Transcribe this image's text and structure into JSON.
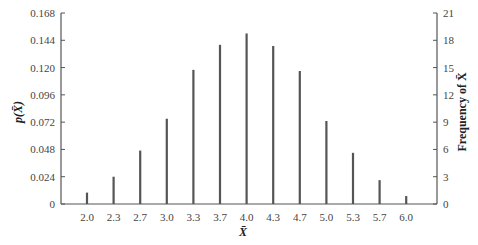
{
  "chart_data": {
    "type": "bar",
    "title": "",
    "xlabel": "X̄",
    "ylabel": "p(X̄)",
    "y2label": "Frequency of X̄",
    "categories": [
      "2.0",
      "2.3",
      "2.7",
      "3.0",
      "3.3",
      "3.7",
      "4.0",
      "4.3",
      "4.7",
      "5.0",
      "5.3",
      "5.7",
      "6.0"
    ],
    "values": [
      0.01,
      0.024,
      0.047,
      0.075,
      0.118,
      0.14,
      0.15,
      0.139,
      0.117,
      0.073,
      0.045,
      0.021,
      0.007
    ],
    "ylim": [
      0,
      0.168
    ],
    "yticks": [
      "0",
      "0.024",
      "0.048",
      "0.072",
      "0.096",
      "0.120",
      "0.144",
      "0.168"
    ],
    "y2lim": [
      0,
      21
    ],
    "y2ticks": [
      "0",
      "3",
      "6",
      "9",
      "12",
      "15",
      "18",
      "21"
    ],
    "grid": false,
    "legend": "none",
    "bar_color": "#555555"
  }
}
